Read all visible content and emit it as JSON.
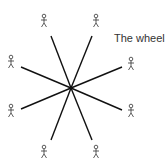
{
  "title": "The wheel",
  "center": {
    "x": 71,
    "y": 88
  },
  "colors": {
    "line": "#111111",
    "figure": "#333333",
    "background": "#ffffff"
  },
  "nodes": [
    {
      "id": "person-top-left",
      "x": 44,
      "y": 22,
      "line_end": {
        "x": 51,
        "y": 36
      }
    },
    {
      "id": "person-top-right",
      "x": 96,
      "y": 22,
      "line_end": {
        "x": 92,
        "y": 36
      }
    },
    {
      "id": "person-left-upper",
      "x": 11,
      "y": 63,
      "line_end": {
        "x": 21,
        "y": 67
      }
    },
    {
      "id": "person-right-upper",
      "x": 131,
      "y": 65,
      "line_end": {
        "x": 122,
        "y": 67
      }
    },
    {
      "id": "person-left-lower",
      "x": 11,
      "y": 112,
      "line_end": {
        "x": 21,
        "y": 109
      }
    },
    {
      "id": "person-right-lower",
      "x": 131,
      "y": 112,
      "line_end": {
        "x": 122,
        "y": 110
      }
    },
    {
      "id": "person-bottom-left",
      "x": 44,
      "y": 153,
      "line_end": {
        "x": 51,
        "y": 140
      }
    },
    {
      "id": "person-bottom-right",
      "x": 96,
      "y": 153,
      "line_end": {
        "x": 92,
        "y": 140
      }
    }
  ]
}
